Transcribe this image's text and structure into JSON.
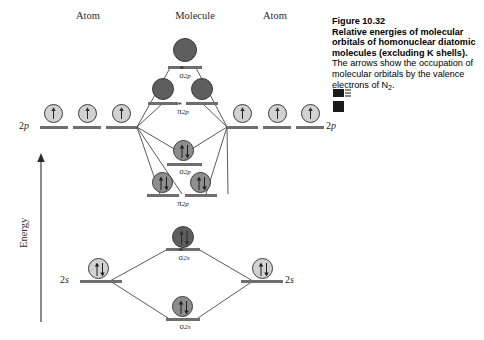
{
  "figure": {
    "number": "Figure 10.32",
    "title_bold": "Relative energies of molecular orbitals of homonuclear diatomic molecules (excluding K shells).",
    "body_text": " The arrows show the occupation of molecular orbitals by the valence electrons of N",
    "body_subscript": "2",
    "body_end": ".",
    "icons": [
      "media-flag-icon",
      "media-block-icon"
    ]
  },
  "columns": {
    "left": "Atom",
    "center": "Molecule",
    "right": "Atom"
  },
  "axis": {
    "label": "Energy",
    "direction": "up",
    "arrow_icon": "up-arrow-icon"
  },
  "atomic_levels": [
    {
      "id": "left-2p",
      "label": "2p",
      "side": "left",
      "electrons": [
        1,
        1,
        1
      ]
    },
    {
      "id": "right-2p",
      "label": "2p",
      "side": "right",
      "electrons": [
        1,
        1,
        1
      ]
    },
    {
      "id": "left-2s",
      "label": "2s",
      "side": "left",
      "electrons": [
        2
      ]
    },
    {
      "id": "right-2s",
      "label": "2s",
      "side": "right",
      "electrons": [
        2
      ]
    }
  ],
  "molecular_orbitals": [
    {
      "id": "sigma-star-2p",
      "symbol": "σ",
      "star": "*",
      "sub": "2p",
      "antibonding": true,
      "occupancy": [
        0
      ]
    },
    {
      "id": "pi-star-2p",
      "symbol": "π",
      "star": "*",
      "sub": "2p",
      "antibonding": true,
      "occupancy": [
        0,
        0
      ]
    },
    {
      "id": "sigma-2p",
      "symbol": "σ",
      "star": "",
      "sub": "2p",
      "antibonding": false,
      "occupancy": [
        2
      ]
    },
    {
      "id": "pi-2p",
      "symbol": "π",
      "star": "",
      "sub": "2p",
      "antibonding": false,
      "occupancy": [
        2,
        2
      ]
    },
    {
      "id": "sigma-star-2s",
      "symbol": "σ",
      "star": "*",
      "sub": "2s",
      "antibonding": true,
      "occupancy": [
        2
      ]
    },
    {
      "id": "sigma-2s",
      "symbol": "σ",
      "star": "",
      "sub": "2s",
      "antibonding": false,
      "occupancy": [
        2
      ]
    }
  ],
  "colors": {
    "bar": "#6e6e6e",
    "empty_orbital": "#5e5e5e",
    "filled_orbital": "#8e8e8e",
    "atomic_orbital": "#d2d2d2",
    "line": "#3c3c3c",
    "text": "#1c1c1c"
  }
}
